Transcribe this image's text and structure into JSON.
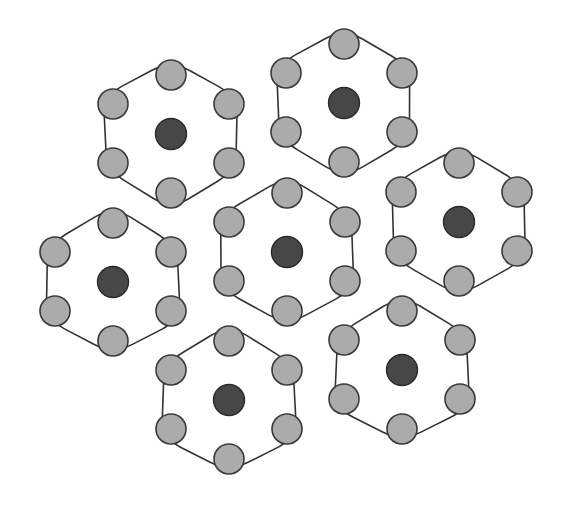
{
  "diagram": {
    "title": "",
    "colors": {
      "background": "#ffffff",
      "boundary_stroke": "#333333",
      "outer_node_fill": "#ababab",
      "center_node_fill": "#474747",
      "node_stroke": "#3a3a3a"
    },
    "node_radius": 15,
    "boundary_radius": 76,
    "clusters": [
      {
        "id": "cluster-top-left",
        "cx": 171,
        "cy": 134
      },
      {
        "id": "cluster-top-center",
        "cx": 344,
        "cy": 103
      },
      {
        "id": "cluster-right",
        "cx": 459,
        "cy": 222
      },
      {
        "id": "cluster-center",
        "cx": 287,
        "cy": 252
      },
      {
        "id": "cluster-left",
        "cx": 113,
        "cy": 282
      },
      {
        "id": "cluster-bottom-center",
        "cx": 229,
        "cy": 400
      },
      {
        "id": "cluster-bottom-right",
        "cx": 402,
        "cy": 370
      }
    ],
    "outer_node_offsets": [
      {
        "dx": 0,
        "dy": -59
      },
      {
        "dx": -58,
        "dy": -30
      },
      {
        "dx": 58,
        "dy": -30
      },
      {
        "dx": -58,
        "dy": 29
      },
      {
        "dx": 58,
        "dy": 29
      },
      {
        "dx": 0,
        "dy": 59
      }
    ]
  }
}
